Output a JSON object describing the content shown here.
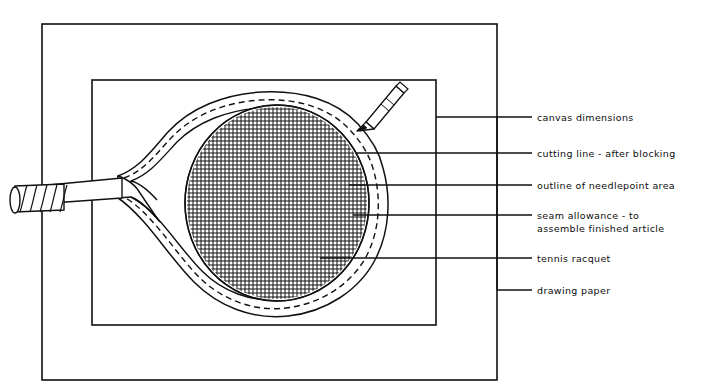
{
  "diagram": {
    "medium": "hand-drawn ink line illustration",
    "background_color": "#ffffff",
    "ink_color": "#111111"
  },
  "frames": {
    "drawing_paper": {
      "name": "drawing paper",
      "x": 42,
      "y": 24,
      "width": 455,
      "height": 356
    },
    "canvas": {
      "name": "canvas",
      "x": 92,
      "y": 80,
      "width": 344,
      "height": 245
    }
  },
  "racquet": {
    "name": "tennis racquet",
    "head_center_x": 277,
    "head_center_y": 203,
    "head_radius_x": 92,
    "head_radius_y": 98,
    "handle_tip_x": 10,
    "grip_stripes": 5,
    "mesh_spacing_px": 4
  },
  "pencil": {
    "name": "pencil",
    "tip_x": 357,
    "tip_y": 131,
    "end_x": 404,
    "end_y": 84
  },
  "callouts": [
    {
      "id": "canvas-dimensions",
      "lines": [
        "canvas dimensions"
      ],
      "leader_y": 117,
      "leader_start_x": 436,
      "leader_end_x": 532,
      "text_x": 537
    },
    {
      "id": "cutting-line",
      "lines": [
        "cutting line - after blocking"
      ],
      "leader_y": 153,
      "leader_start_x": 356,
      "leader_end_x": 532,
      "text_x": 537
    },
    {
      "id": "needlepoint-outline",
      "lines": [
        "outline of needlepoint area"
      ],
      "leader_y": 185,
      "leader_start_x": 349,
      "leader_end_x": 532,
      "text_x": 537
    },
    {
      "id": "seam-allowance",
      "lines": [
        "seam allowance - to",
        "assemble finished article"
      ],
      "leader_y": 215,
      "leader_start_x": 353,
      "leader_end_x": 532,
      "text_x": 537
    },
    {
      "id": "tennis-racquet",
      "lines": [
        "tennis racquet"
      ],
      "leader_y": 258,
      "leader_start_x": 320,
      "leader_end_x": 532,
      "text_x": 537
    },
    {
      "id": "drawing-paper",
      "lines": [
        "drawing paper"
      ],
      "leader_y": 290,
      "leader_start_x": 497,
      "leader_end_x": 532,
      "text_x": 537
    }
  ],
  "spine": {
    "name": "callout-spine",
    "x": 497,
    "y_top": 117,
    "y_bottom": 290
  }
}
